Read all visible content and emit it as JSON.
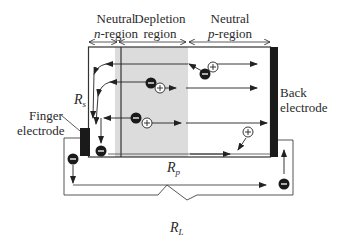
{
  "diagram": {
    "type": "solar-cell-cross-section",
    "regions": [
      {
        "line1": "Neutral",
        "line2": "n-region",
        "line2_prefix": "n",
        "line2_suffix": "-region"
      },
      {
        "line1": "Depletion",
        "line2": "region"
      },
      {
        "line1": "Neutral",
        "line2": "p-region",
        "line2_prefix": "p",
        "line2_suffix": "-region"
      }
    ],
    "electrodes": {
      "finger": {
        "line1": "Finger",
        "line2": "electrode"
      },
      "back": {
        "line1": "Back",
        "line2": "electrode"
      }
    },
    "resistors": {
      "series": {
        "symbol": "R",
        "subscript": "s"
      },
      "parallel": {
        "symbol": "R",
        "subscript": "p"
      },
      "load": {
        "symbol": "R",
        "subscript": "L"
      }
    },
    "carriers": {
      "electron_symbol": "−",
      "hole_symbol": "+"
    },
    "colors": {
      "line": "#333333",
      "depletion_fill": "#dcdcdc",
      "electrode": "#1a1a1a",
      "background": "#ffffff"
    }
  }
}
